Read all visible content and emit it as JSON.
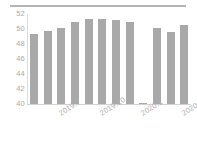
{
  "chart_data": {
    "type": "bar",
    "title": "",
    "subtitle": "",
    "xlabel": "",
    "ylabel": "",
    "categories": [
      "2019.5",
      "2019.6",
      "2019.7",
      "2019.8",
      "2019.9",
      "2019.10",
      "2019.11",
      "2019.12",
      "2020.1",
      "2020.2",
      "2020.3",
      "2020.4"
    ],
    "values": [
      49.4,
      49.8,
      50.2,
      51.0,
      51.3,
      51.3,
      51.2,
      50.9,
      40.1,
      50.2,
      49.6,
      50.6
    ],
    "ylim": [
      40,
      52
    ],
    "yticks": [
      52,
      50,
      48,
      46,
      44,
      42,
      40
    ],
    "ytick_labels": [
      "52",
      "50",
      "48",
      "46",
      "44",
      "42",
      "40"
    ],
    "xtick_positions": [
      2,
      5,
      8,
      11
    ],
    "xtick_labels": [
      "2019.7",
      "2019.10",
      "2020.1",
      "2020.4"
    ],
    "grid": false,
    "legend": null,
    "series": [
      {
        "name": "value",
        "values": [
          49.4,
          49.8,
          50.2,
          51.0,
          51.3,
          51.3,
          51.2,
          50.9,
          40.1,
          50.2,
          49.6,
          50.6
        ]
      }
    ],
    "colors": {
      "bar": "#a9a9a9",
      "axis": "#d2d2d2",
      "tick_text": "#aaaaaa",
      "top_rule": "#9a9a9a",
      "background": "#ffffff"
    }
  }
}
